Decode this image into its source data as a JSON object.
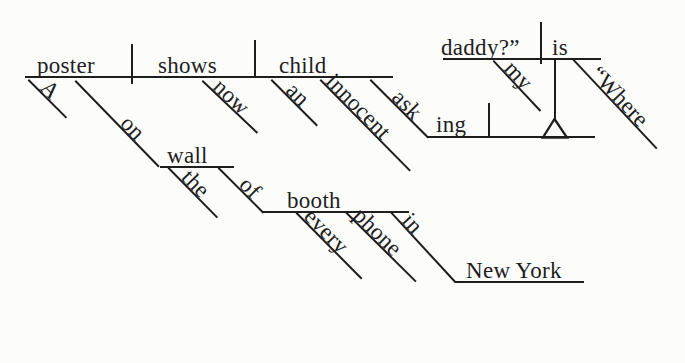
{
  "diagram": {
    "type": "reed-kellogg-sentence-diagram",
    "reading": "A poster on the wall of every phone booth in New York now shows an innocent child asking “Where is my daddy?”",
    "ink_color": "#1e1e1e",
    "paper_color": "#fcfcfb"
  },
  "words": {
    "main": {
      "subject": "poster",
      "verb": "shows",
      "object": "child"
    },
    "subject_modifiers": {
      "a": "A",
      "on": "on"
    },
    "verb_modifiers": {
      "now": "now"
    },
    "object_modifiers": {
      "an": "an",
      "innocent": "innocent"
    },
    "participle": {
      "stem": "ask",
      "suffix": "ing"
    },
    "prep_phrases": {
      "wall": "wall",
      "the": "the",
      "of": "of",
      "booth": "booth",
      "every": "every",
      "phone": "phone",
      "in": "in",
      "new_york": "New York"
    },
    "quote_clause": {
      "subject": "daddy?”",
      "verb": "is",
      "my": "my",
      "where": "“Where"
    }
  }
}
